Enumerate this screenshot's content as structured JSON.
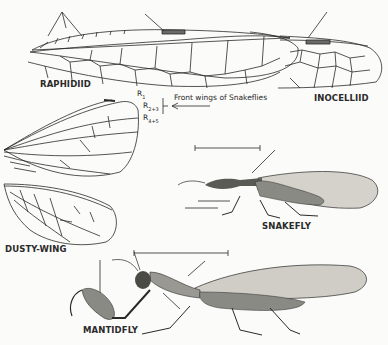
{
  "figure": {
    "caption": "Front wings of Snakeflies",
    "labels": {
      "raphidiid": "RAPHIDIID",
      "inocelliid": "INOCELLIID",
      "dusty_wing": "DUSTY-WING",
      "snakefly": "SNAKEFLY",
      "mantidfly": "MANTIDFLY"
    },
    "veins": {
      "r1": {
        "base": "R",
        "sub": "1"
      },
      "r23": {
        "base": "R",
        "sub": "2+3"
      },
      "r45": {
        "base": "R",
        "sub": "4+5"
      }
    },
    "colors": {
      "ink": "#2a2a2a",
      "paper": "#fbfbf9",
      "body_tone": "#8a8a84",
      "wing_tone": "#c9c7c0"
    }
  }
}
